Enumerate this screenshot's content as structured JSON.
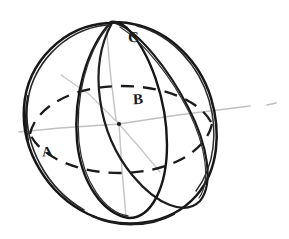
{
  "figure": {
    "kind": "geometry-sketch",
    "background_color": "#ffffff",
    "width": 289,
    "height": 239
  },
  "labels": {
    "a": "A",
    "b": "B",
    "c": "C"
  },
  "colors": {
    "ink_dark": "#141414",
    "ink_mid": "#3a3a3a",
    "axis_faint": "#b9b9b9",
    "axis_very_faint": "#d2d2d2",
    "paper": "#ffffff"
  },
  "geometry": {
    "sphere_center": {
      "x": 119,
      "y": 124
    },
    "sphere_radius_x": 96,
    "sphere_radius_y": 101,
    "equator_style": "dashed",
    "meridian_count": 2,
    "axis_extends_outside": true,
    "axis_right_tip": {
      "x": 273,
      "y": 104
    },
    "axis_left_tip": {
      "x": 18,
      "y": 132
    }
  },
  "elements": {
    "sphere_outline": "sphere-outline",
    "equator_dashed": "equator-dashed-ellipse",
    "meridian_narrow": "meridian-narrow-ellipse",
    "meridian_wide": "meridian-wide-ellipse",
    "polar_axis": "polar-axis-line",
    "tilted_axis": "tilted-axis-line",
    "chord_upper_left": "chord-upper-left",
    "chord_lower_right": "chord-lower-right",
    "axis_tick_far_right": "axis-tick-far-right"
  }
}
